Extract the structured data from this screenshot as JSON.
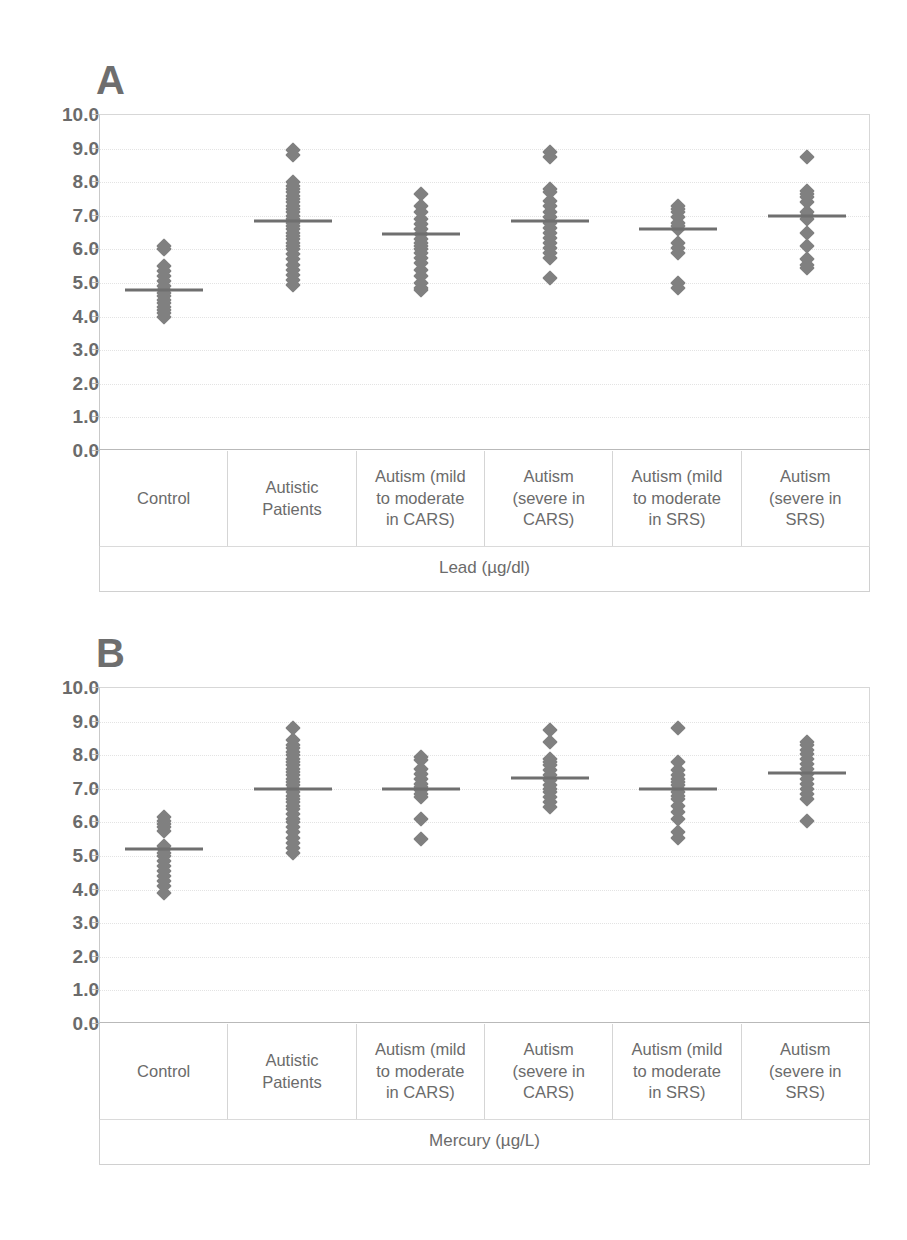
{
  "figure": {
    "panels": [
      {
        "letter": "A",
        "axis_title": "Lead (µg/dl)"
      },
      {
        "letter": "B",
        "axis_title": "Mercury (µg/L)"
      }
    ],
    "categories": [
      "Control",
      "Autistic\nPatients",
      "Autism (mild\nto moderate\nin CARS)",
      "Autism\n(severe in\nCARS)",
      "Autism (mild\nto moderate\nin SRS)",
      "Autism\n(severe in\nSRS)"
    ],
    "ytick_labels": [
      "10.0",
      "9.0",
      "8.0",
      "7.0",
      "6.0",
      "5.0",
      "4.0",
      "3.0",
      "2.0",
      "1.0",
      "0.0"
    ],
    "marker_color": "#808080",
    "median_color": "#6f6f6f",
    "grid_color": "#e3e3e3"
  },
  "chart_data": [
    {
      "type": "scatter",
      "title": "A",
      "xlabel": "Lead (µg/dl)",
      "ylabel": "",
      "ylim": [
        0.0,
        10.0
      ],
      "ytick_step": 1.0,
      "grid": true,
      "legend": "none",
      "categories": [
        "Control",
        "Autistic Patients",
        "Autism (mild to moderate in CARS)",
        "Autism (severe in CARS)",
        "Autism (mild to moderate in SRS)",
        "Autism (severe in SRS)"
      ],
      "medians": [
        4.8,
        6.85,
        6.45,
        6.85,
        6.6,
        6.98
      ],
      "groups": [
        {
          "name": "Control",
          "median": 4.8,
          "values": [
            6.1,
            6.0,
            5.5,
            5.35,
            5.2,
            5.05,
            4.9,
            4.8,
            4.7,
            4.6,
            4.5,
            4.4,
            4.3,
            4.2,
            4.1,
            4.0
          ]
        },
        {
          "name": "Autistic Patients",
          "median": 6.85,
          "values": [
            8.95,
            8.8,
            8.0,
            7.9,
            7.8,
            7.7,
            7.6,
            7.5,
            7.4,
            7.3,
            7.2,
            7.1,
            7.0,
            6.9,
            6.8,
            6.7,
            6.6,
            6.5,
            6.4,
            6.3,
            6.2,
            6.1,
            6.0,
            5.85,
            5.7,
            5.55,
            5.4,
            5.25,
            5.1,
            4.95
          ]
        },
        {
          "name": "Autism (mild to moderate in CARS)",
          "median": 6.45,
          "values": [
            7.65,
            7.3,
            7.1,
            6.9,
            6.75,
            6.6,
            6.45,
            6.3,
            6.2,
            6.1,
            6.0,
            5.9,
            5.75,
            5.6,
            5.4,
            5.2,
            5.0,
            4.85,
            4.8
          ]
        },
        {
          "name": "Autism (severe in CARS)",
          "median": 6.85,
          "values": [
            8.9,
            8.75,
            7.8,
            7.7,
            7.45,
            7.3,
            7.1,
            6.95,
            6.8,
            6.65,
            6.5,
            6.35,
            6.2,
            6.05,
            5.9,
            5.75,
            5.15
          ]
        },
        {
          "name": "Autism (mild to moderate in SRS)",
          "median": 6.6,
          "values": [
            7.3,
            7.2,
            7.1,
            6.95,
            6.8,
            6.7,
            6.6,
            6.2,
            6.05,
            5.9,
            5.0,
            4.85
          ]
        },
        {
          "name": "Autism (severe in SRS)",
          "median": 6.98,
          "values": [
            8.75,
            7.75,
            7.65,
            7.55,
            7.4,
            7.1,
            7.0,
            6.9,
            6.5,
            6.1,
            5.7,
            5.55,
            5.45
          ]
        }
      ]
    },
    {
      "type": "scatter",
      "title": "B",
      "xlabel": "Mercury (µg/L)",
      "ylabel": "",
      "ylim": [
        0.0,
        10.0
      ],
      "ytick_step": 1.0,
      "grid": true,
      "legend": "none",
      "categories": [
        "Control",
        "Autistic Patients",
        "Autism (mild to moderate in CARS)",
        "Autism (severe in CARS)",
        "Autism (mild to moderate in SRS)",
        "Autism (severe in SRS)"
      ],
      "medians": [
        5.2,
        7.0,
        7.0,
        7.32,
        7.0,
        7.48
      ],
      "groups": [
        {
          "name": "Control",
          "median": 5.2,
          "values": [
            6.15,
            6.05,
            5.95,
            5.85,
            5.75,
            5.3,
            5.2,
            5.1,
            5.0,
            4.85,
            4.7,
            4.55,
            4.4,
            4.25,
            4.1,
            3.9
          ]
        },
        {
          "name": "Autistic Patients",
          "median": 7.0,
          "values": [
            8.8,
            8.45,
            8.3,
            8.2,
            8.1,
            8.0,
            7.9,
            7.8,
            7.7,
            7.6,
            7.5,
            7.4,
            7.3,
            7.2,
            7.1,
            7.0,
            6.9,
            6.8,
            6.7,
            6.6,
            6.5,
            6.4,
            6.25,
            6.1,
            6.0,
            5.85,
            5.7,
            5.55,
            5.4,
            5.25,
            5.1
          ]
        },
        {
          "name": "Autism (mild to moderate in CARS)",
          "median": 7.0,
          "values": [
            7.95,
            7.85,
            7.6,
            7.45,
            7.3,
            7.15,
            7.05,
            6.95,
            6.85,
            6.75,
            6.1,
            5.5
          ]
        },
        {
          "name": "Autism (severe in CARS)",
          "median": 7.32,
          "values": [
            8.75,
            8.4,
            7.9,
            7.8,
            7.7,
            7.55,
            7.4,
            7.25,
            7.1,
            7.0,
            6.9,
            6.75,
            6.6,
            6.45
          ]
        },
        {
          "name": "Autism (mild to moderate in SRS)",
          "median": 7.0,
          "values": [
            8.8,
            7.8,
            7.55,
            7.4,
            7.3,
            7.2,
            7.1,
            7.0,
            6.9,
            6.8,
            6.7,
            6.5,
            6.3,
            6.1,
            5.7,
            5.55
          ]
        },
        {
          "name": "Autism (severe in SRS)",
          "median": 7.48,
          "values": [
            8.4,
            8.3,
            8.15,
            8.05,
            7.9,
            7.75,
            7.6,
            7.45,
            7.3,
            7.15,
            7.0,
            6.85,
            6.7,
            6.05
          ]
        }
      ]
    }
  ]
}
